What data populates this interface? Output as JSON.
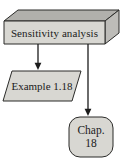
{
  "diagram": {
    "nodes": {
      "sensitivity_box": {
        "shape": "3d-box",
        "label": "Sensitivity analysis"
      },
      "example_parallelogram": {
        "shape": "parallelogram",
        "label": "Example 1.18"
      },
      "chapter_box": {
        "shape": "rounded-rectangle",
        "line1": "Chap.",
        "line2": "18"
      }
    },
    "edges": [
      {
        "from": "sensitivity_box",
        "to": "example_parallelogram",
        "style": "arrow-down"
      },
      {
        "from": "sensitivity_box",
        "to": "chapter_box",
        "style": "arrow-down"
      }
    ],
    "colors": {
      "node_fill": "#d8d7d2",
      "box_top_fill": "#b1b0ac",
      "box_side_fill": "#bdbcb8",
      "outline": "#2b2b29",
      "arrow": "#1c1c1c",
      "text": "#1b1b1b",
      "background": "#ffffff"
    }
  }
}
